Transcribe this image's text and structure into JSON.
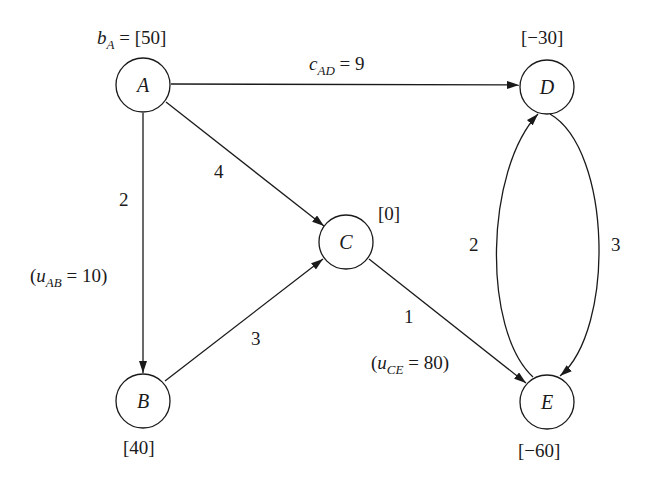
{
  "diagram": {
    "type": "min-cost network flow",
    "nodes": [
      {
        "id": "A",
        "label": "A",
        "supply_label": "[50]",
        "supply_prefix": "b",
        "supply_sub": "A",
        "supply_eq": " = ",
        "supply": 50
      },
      {
        "id": "B",
        "label": "B",
        "supply_label": "[40]",
        "supply": 40
      },
      {
        "id": "C",
        "label": "C",
        "supply_label": "[0]",
        "supply": 0
      },
      {
        "id": "D",
        "label": "D",
        "supply_label": "[−30]",
        "supply": -30
      },
      {
        "id": "E",
        "label": "E",
        "supply_label": "[−60]",
        "supply": -60
      }
    ],
    "edges": [
      {
        "from": "A",
        "to": "D",
        "cost": 9,
        "cost_label_prefix": "c",
        "cost_label_sub": "AD",
        "cost_label_rest": " = 9"
      },
      {
        "from": "A",
        "to": "C",
        "cost": 4,
        "cost_label": "4"
      },
      {
        "from": "A",
        "to": "B",
        "cost": 2,
        "cost_label": "2",
        "capacity": 10,
        "cap_open": "(",
        "cap_prefix": "u",
        "cap_sub": "AB",
        "cap_rest": " = 10)"
      },
      {
        "from": "B",
        "to": "C",
        "cost": 3,
        "cost_label": "3"
      },
      {
        "from": "C",
        "to": "E",
        "cost": 1,
        "cost_label": "1",
        "capacity": 80,
        "cap_open": "(",
        "cap_prefix": "u",
        "cap_sub": "CE",
        "cap_rest": " = 80)"
      },
      {
        "from": "D",
        "to": "E",
        "cost": 3,
        "cost_label": "3"
      },
      {
        "from": "E",
        "to": "D",
        "cost": 2,
        "cost_label": "2"
      }
    ]
  }
}
